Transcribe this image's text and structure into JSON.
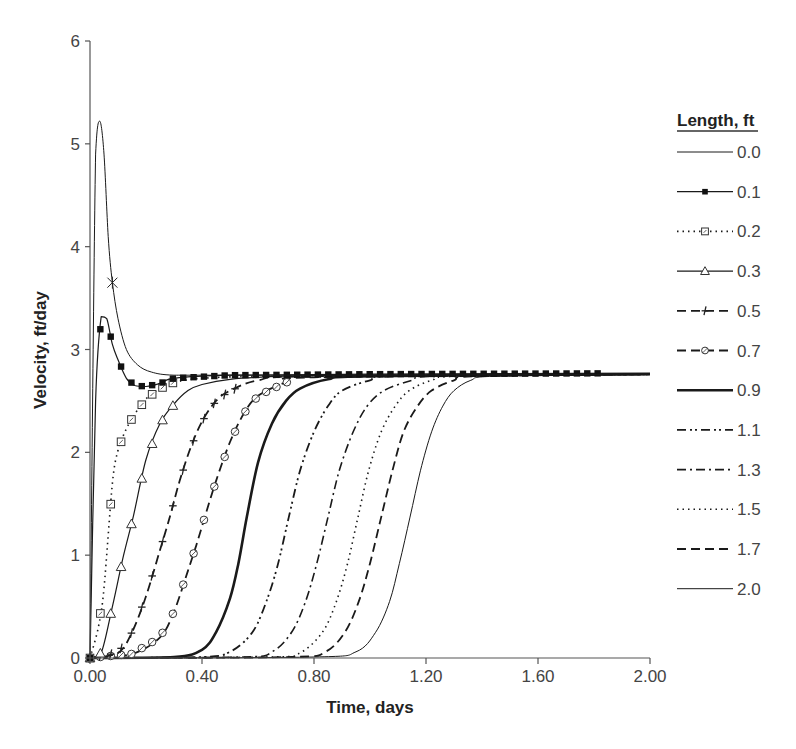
{
  "chart_data": {
    "type": "line",
    "title": "",
    "xlabel": "Time, days",
    "ylabel": "Velocity, ft/day",
    "xlim": [
      0,
      2.0
    ],
    "ylim": [
      0,
      6
    ],
    "x_ticks": [
      "0.00",
      "0.40",
      "0.80",
      "1.20",
      "1.60",
      "2.00"
    ],
    "y_ticks": [
      "0",
      "1",
      "2",
      "3",
      "4",
      "5",
      "6"
    ],
    "grid": false,
    "legend": {
      "title": "Length, ft",
      "position": "right",
      "entries": [
        "0.0",
        "0.1",
        "0.2",
        "0.3",
        "0.5",
        "0.7",
        "0.9",
        "1.1",
        "1.3",
        "1.5",
        "1.7",
        "2.0"
      ]
    },
    "steady_state_velocity": 2.75,
    "series": [
      {
        "name": "0.0",
        "style": "thin-solid",
        "marker": "star-single",
        "x": [
          0.0,
          0.02,
          0.035,
          0.05,
          0.065,
          0.08,
          0.1,
          0.13,
          0.17,
          0.22,
          0.3,
          0.5,
          1.0,
          2.0
        ],
        "y": [
          0.0,
          4.9,
          5.22,
          4.9,
          4.1,
          3.65,
          3.3,
          3.0,
          2.85,
          2.78,
          2.75,
          2.75,
          2.75,
          2.76
        ]
      },
      {
        "name": "0.1",
        "style": "solid",
        "marker": "filled-square",
        "x": [
          0.0,
          0.02,
          0.04,
          0.06,
          0.08,
          0.1,
          0.13,
          0.16,
          0.2,
          0.25,
          0.3,
          0.5,
          1.0,
          2.0
        ],
        "y": [
          0.0,
          2.5,
          3.32,
          3.3,
          3.05,
          2.9,
          2.72,
          2.65,
          2.64,
          2.67,
          2.72,
          2.75,
          2.76,
          2.77
        ]
      },
      {
        "name": "0.2",
        "style": "dotted",
        "marker": "open-square",
        "x": [
          0.0,
          0.03,
          0.05,
          0.08,
          0.1,
          0.12,
          0.15,
          0.2,
          0.25,
          0.3,
          0.4,
          0.6,
          1.0,
          2.0
        ],
        "y": [
          0.0,
          0.3,
          0.68,
          1.7,
          2.02,
          2.17,
          2.33,
          2.52,
          2.62,
          2.68,
          2.72,
          2.74,
          2.75,
          2.76
        ]
      },
      {
        "name": "0.3",
        "style": "solid",
        "marker": "open-triangle",
        "x": [
          0.0,
          0.04,
          0.08,
          0.12,
          0.155,
          0.2,
          0.25,
          0.3,
          0.35,
          0.4,
          0.5,
          0.7,
          1.0,
          2.0
        ],
        "y": [
          0.0,
          0.05,
          0.5,
          1.0,
          1.38,
          1.93,
          2.28,
          2.47,
          2.6,
          2.66,
          2.71,
          2.74,
          2.75,
          2.76
        ]
      },
      {
        "name": "0.5",
        "style": "dashed",
        "marker": "plus",
        "x": [
          0.0,
          0.1,
          0.15,
          0.2,
          0.25,
          0.285,
          0.32,
          0.36,
          0.4,
          0.45,
          0.5,
          0.6,
          0.8,
          2.0
        ],
        "y": [
          0.0,
          0.05,
          0.25,
          0.6,
          1.05,
          1.37,
          1.72,
          2.05,
          2.3,
          2.5,
          2.6,
          2.7,
          2.74,
          2.76
        ]
      },
      {
        "name": "0.7",
        "style": "dashed",
        "marker": "open-circle",
        "x": [
          0.0,
          0.15,
          0.25,
          0.3,
          0.35,
          0.38,
          0.41,
          0.45,
          0.5,
          0.55,
          0.6,
          0.7,
          0.8,
          2.0
        ],
        "y": [
          0.0,
          0.04,
          0.2,
          0.45,
          0.85,
          1.1,
          1.37,
          1.72,
          2.1,
          2.38,
          2.55,
          2.68,
          2.73,
          2.76
        ]
      },
      {
        "name": "0.9",
        "style": "thick-solid",
        "marker": "none",
        "x": [
          0.0,
          0.3,
          0.4,
          0.45,
          0.5,
          0.53,
          0.56,
          0.6,
          0.65,
          0.7,
          0.75,
          0.85,
          1.0,
          2.0
        ],
        "y": [
          0.0,
          0.01,
          0.08,
          0.25,
          0.58,
          0.92,
          1.37,
          1.9,
          2.28,
          2.5,
          2.62,
          2.71,
          2.74,
          2.76
        ]
      },
      {
        "name": "1.1",
        "style": "dash-dot-dot",
        "marker": "none",
        "x": [
          0.0,
          0.4,
          0.5,
          0.58,
          0.63,
          0.67,
          0.71,
          0.75,
          0.8,
          0.85,
          0.9,
          1.0,
          1.1,
          2.0
        ],
        "y": [
          0.0,
          0.01,
          0.06,
          0.25,
          0.55,
          0.9,
          1.37,
          1.82,
          2.2,
          2.45,
          2.6,
          2.7,
          2.74,
          2.76
        ]
      },
      {
        "name": "1.3",
        "style": "dash-dot",
        "marker": "none",
        "x": [
          0.0,
          0.55,
          0.65,
          0.72,
          0.77,
          0.81,
          0.85,
          0.89,
          0.94,
          0.99,
          1.05,
          1.15,
          1.25,
          2.0
        ],
        "y": [
          0.0,
          0.01,
          0.06,
          0.25,
          0.55,
          0.92,
          1.37,
          1.82,
          2.2,
          2.45,
          2.6,
          2.7,
          2.74,
          2.76
        ]
      },
      {
        "name": "1.5",
        "style": "dotted",
        "marker": "none",
        "x": [
          0.0,
          0.65,
          0.75,
          0.83,
          0.88,
          0.92,
          0.957,
          0.995,
          1.04,
          1.09,
          1.14,
          1.22,
          1.32,
          2.0
        ],
        "y": [
          0.0,
          0.01,
          0.05,
          0.25,
          0.55,
          0.92,
          1.37,
          1.82,
          2.2,
          2.45,
          2.6,
          2.7,
          2.74,
          2.76
        ]
      },
      {
        "name": "1.7",
        "style": "dashed",
        "marker": "none",
        "x": [
          0.0,
          0.72,
          0.84,
          0.91,
          0.96,
          1.0,
          1.04,
          1.08,
          1.12,
          1.17,
          1.22,
          1.3,
          1.38,
          2.0
        ],
        "y": [
          0.0,
          0.01,
          0.06,
          0.25,
          0.55,
          0.92,
          1.37,
          1.82,
          2.2,
          2.45,
          2.6,
          2.7,
          2.74,
          2.76
        ]
      },
      {
        "name": "2.0",
        "style": "thin-solid",
        "marker": "none",
        "x": [
          0.0,
          0.8,
          0.95,
          1.02,
          1.07,
          1.105,
          1.143,
          1.18,
          1.22,
          1.26,
          1.3,
          1.36,
          1.45,
          2.0
        ],
        "y": [
          0.0,
          0.01,
          0.06,
          0.25,
          0.55,
          0.92,
          1.37,
          1.82,
          2.2,
          2.45,
          2.6,
          2.7,
          2.74,
          2.76
        ]
      }
    ]
  }
}
